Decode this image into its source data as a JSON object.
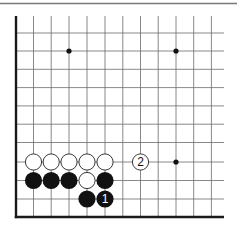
{
  "diagram": {
    "type": "go-board-fragment",
    "corner": "bottom-left",
    "colors": {
      "background": "#ffffff",
      "grid_line": "#6b6b6b",
      "edge_line": "#1a1a1a",
      "top_rule": "#7a7a7a",
      "black_stone": "#111111",
      "white_stone": "#ffffff",
      "star_point": "#111111"
    },
    "columns_x": [
      16,
      33.5,
      51.2,
      69,
      87,
      105,
      122.8,
      140.5,
      158.2,
      176,
      193.7,
      211.4
    ],
    "rows_y": [
      33,
      51,
      69.3,
      87.6,
      105.9,
      124.2,
      142.5,
      162,
      180.5,
      199,
      217
    ],
    "star_points": [
      {
        "col": 3,
        "row": 1
      },
      {
        "col": 9,
        "row": 1
      },
      {
        "col": 9,
        "row": 7
      }
    ],
    "stones": [
      {
        "color": "white",
        "col": 1,
        "row": 7,
        "label": ""
      },
      {
        "color": "white",
        "col": 2,
        "row": 7,
        "label": ""
      },
      {
        "color": "white",
        "col": 3,
        "row": 7,
        "label": ""
      },
      {
        "color": "white",
        "col": 4,
        "row": 7,
        "label": ""
      },
      {
        "color": "white",
        "col": 5,
        "row": 7,
        "label": ""
      },
      {
        "color": "white",
        "col": 7,
        "row": 7,
        "label": "2"
      },
      {
        "color": "black",
        "col": 1,
        "row": 8,
        "label": ""
      },
      {
        "color": "black",
        "col": 2,
        "row": 8,
        "label": ""
      },
      {
        "color": "black",
        "col": 3,
        "row": 8,
        "label": ""
      },
      {
        "color": "white",
        "col": 4,
        "row": 8,
        "label": ""
      },
      {
        "color": "black",
        "col": 5,
        "row": 8,
        "label": ""
      },
      {
        "color": "black",
        "col": 4,
        "row": 9,
        "label": ""
      },
      {
        "color": "black",
        "col": 5,
        "row": 9,
        "label": "1"
      }
    ]
  }
}
